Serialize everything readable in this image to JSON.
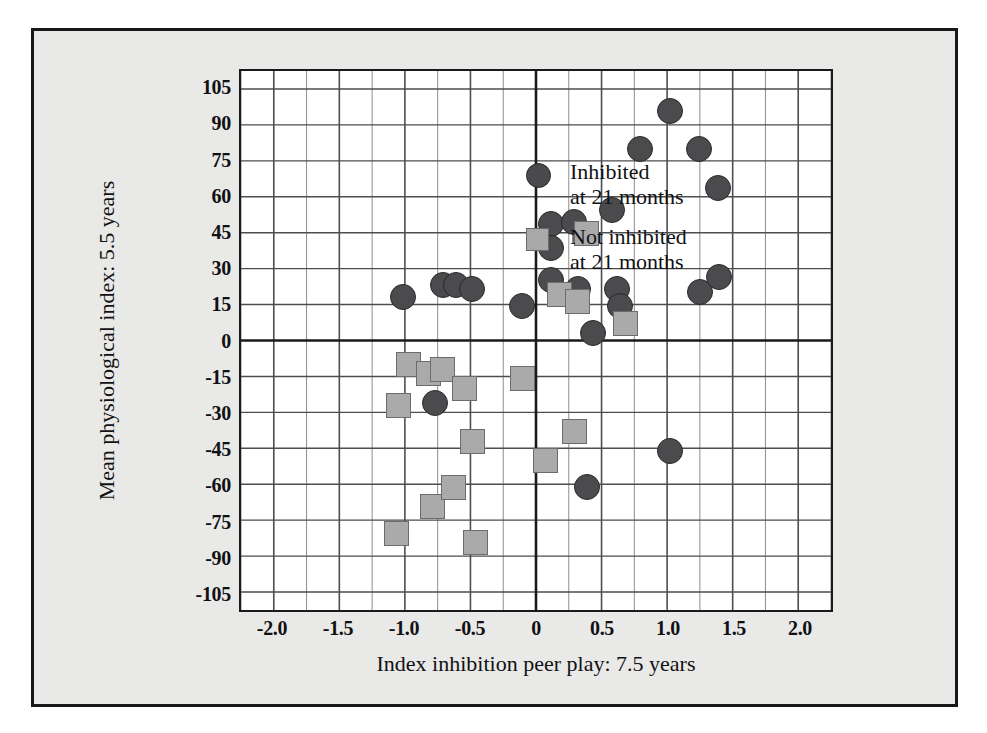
{
  "chart_data": {
    "type": "scatter",
    "title": "",
    "xlabel": "Index inhibition peer play: 7.5 years",
    "ylabel": "Mean physiological index: 5.5 years",
    "xlim": [
      -2.25,
      2.25
    ],
    "ylim": [
      -112.5,
      112.5
    ],
    "xticks": [
      -2.0,
      -1.5,
      -1.0,
      -0.5,
      0,
      0.5,
      1.0,
      1.5,
      2.0
    ],
    "xtick_labels": [
      "-2.0",
      "-1.5",
      "-1.0",
      "-0.5",
      "0",
      "0.5",
      "1.0",
      "1.5",
      "2.0"
    ],
    "yticks": [
      105,
      90,
      75,
      60,
      45,
      30,
      15,
      0,
      -15,
      -30,
      -45,
      -60,
      -75,
      -90,
      -105
    ],
    "ytick_labels": [
      "105",
      "90",
      "75",
      "60",
      "45",
      "30",
      "15",
      "0",
      "-15",
      "-30",
      "-45",
      "-60",
      "-75",
      "-90",
      "-105"
    ],
    "grid": true,
    "grid_minor_x_step": 0.25,
    "grid_major_x_step": 0.5,
    "grid_y_step": 15,
    "zero_lines": {
      "x": 0,
      "y": 0
    },
    "legend_position": "top-left",
    "series": [
      {
        "name": "Inhibited at 21 months",
        "marker": "circle",
        "color": "#4b4b4d",
        "edge_color": "#29292b",
        "points": [
          {
            "x": -1.02,
            "y": 19
          },
          {
            "x": -0.72,
            "y": 24
          },
          {
            "x": -0.62,
            "y": 24
          },
          {
            "x": -0.5,
            "y": 22
          },
          {
            "x": -0.78,
            "y": -25
          },
          {
            "x": -0.12,
            "y": 15
          },
          {
            "x": 0.1,
            "y": 49
          },
          {
            "x": 0.1,
            "y": 39
          },
          {
            "x": 0.1,
            "y": 26
          },
          {
            "x": 0.27,
            "y": 50
          },
          {
            "x": 0.3,
            "y": 22
          },
          {
            "x": 0.42,
            "y": 4
          },
          {
            "x": 0.37,
            "y": -60
          },
          {
            "x": 0.56,
            "y": 55
          },
          {
            "x": 0.6,
            "y": 22
          },
          {
            "x": 0.62,
            "y": 15
          },
          {
            "x": 0.77,
            "y": 80
          },
          {
            "x": 1.0,
            "y": 96
          },
          {
            "x": 1.0,
            "y": -45
          },
          {
            "x": 1.22,
            "y": 80
          },
          {
            "x": 1.23,
            "y": 21
          },
          {
            "x": 1.36,
            "y": 64
          },
          {
            "x": 1.37,
            "y": 27
          }
        ]
      },
      {
        "name": "Not inhibited at 21 months",
        "marker": "square",
        "color": "#aaaaaa",
        "edge_color": "#6c6c6c",
        "points": [
          {
            "x": -1.06,
            "y": -26
          },
          {
            "x": -1.07,
            "y": -79
          },
          {
            "x": -0.98,
            "y": -9
          },
          {
            "x": -0.83,
            "y": -13
          },
          {
            "x": -0.8,
            "y": -68
          },
          {
            "x": -0.72,
            "y": -11
          },
          {
            "x": -0.64,
            "y": -60
          },
          {
            "x": -0.56,
            "y": -19
          },
          {
            "x": -0.5,
            "y": -41
          },
          {
            "x": -0.47,
            "y": -83
          },
          {
            "x": -0.12,
            "y": -15
          },
          {
            "x": 0.06,
            "y": -49
          },
          {
            "x": 0.16,
            "y": 20
          },
          {
            "x": 0.28,
            "y": -37
          },
          {
            "x": 0.3,
            "y": 17
          },
          {
            "x": 0.37,
            "y": 45
          },
          {
            "x": 0.66,
            "y": 8
          }
        ]
      }
    ]
  },
  "legend": {
    "items": [
      {
        "marker": "circle",
        "line1": "Inhibited",
        "line2": "at 21 months"
      },
      {
        "marker": "square",
        "line1": "Not inhibited",
        "line2": "at 21 months"
      }
    ]
  },
  "colors": {
    "background": "#e9e9e7",
    "frame_border": "#18181a",
    "plot_background": "#ffffff",
    "axis": "#1a1a1c",
    "grid_major": "#4d4d50",
    "grid_minor": "#8c8c8f",
    "inhibited_fill": "#4b4b4d",
    "not_inhibited_fill": "#aaaaaa",
    "text": "#111114"
  }
}
